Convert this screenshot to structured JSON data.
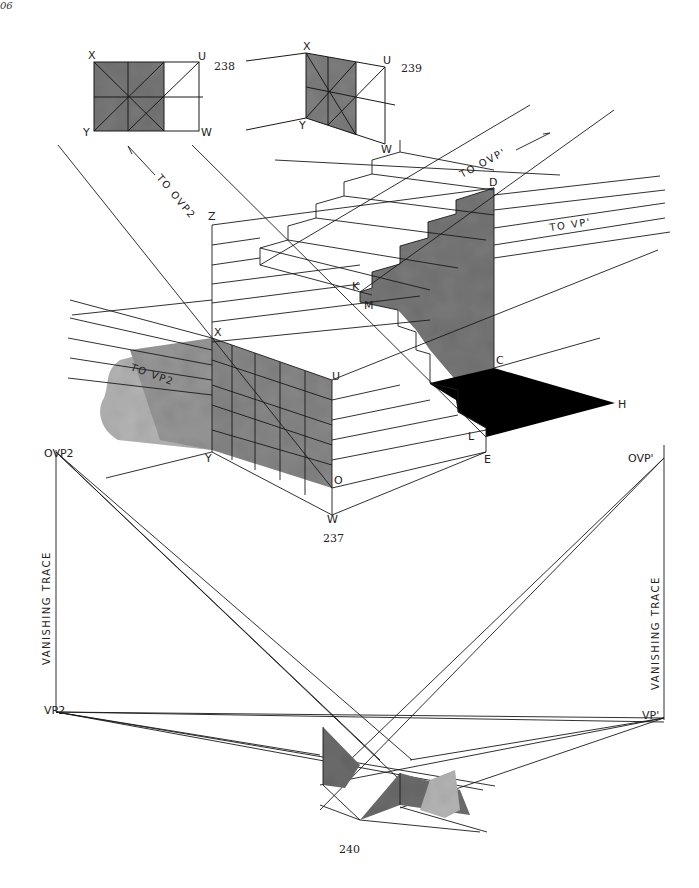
{
  "page": {
    "page_number": "06",
    "figure_captions": [
      "238",
      "239",
      "237",
      "240"
    ]
  },
  "figure_238": {
    "caption": "238",
    "labels": {
      "x": "X",
      "u": "U",
      "y": "Y",
      "w": "W"
    }
  },
  "figure_239": {
    "caption": "239",
    "labels": {
      "x": "X",
      "u": "U",
      "y": "Y",
      "w": "W"
    }
  },
  "figure_237": {
    "caption": "237",
    "labels": {
      "z": "Z",
      "d": "D",
      "k": "K",
      "m": "M",
      "x": "X",
      "u": "U",
      "c": "C",
      "h": "H",
      "y": "Y",
      "l": "L",
      "e": "E",
      "o": "O",
      "w": "W"
    },
    "annotations": {
      "to_ovp2": "TO OVP2",
      "to_ovp1": "TO OVP'",
      "to_vp1": "TO VP'",
      "to_vp2": "TO VP2"
    }
  },
  "figure_240": {
    "caption": "240",
    "labels": {
      "ovp2": "OVP2",
      "ovp1": "OVP'",
      "vp2": "VP2",
      "vp1": "VP'",
      "vanishing_trace_left": "VANISHING TRACE",
      "vanishing_trace_right": "VANISHING TRACE"
    }
  },
  "colors": {
    "ink": "#1a1a1a",
    "wash_dark": "#6e6e6e",
    "wash_mid": "#8c8c8c",
    "wash_light": "#b4b4b4",
    "shadow": "#000000",
    "paper": "#ffffff"
  }
}
